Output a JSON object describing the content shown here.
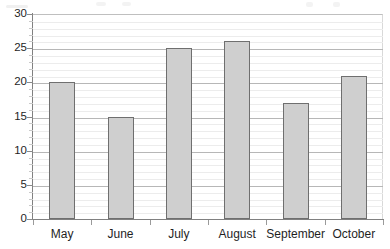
{
  "chart_data": {
    "type": "bar",
    "title": "",
    "xlabel": "",
    "ylabel": "",
    "categories": [
      "May",
      "June",
      "July",
      "August",
      "September",
      "October"
    ],
    "values": [
      20,
      15,
      25,
      26,
      17,
      21
    ],
    "ylim": [
      0,
      30
    ],
    "y_major_ticks": [
      0,
      5,
      10,
      15,
      20,
      25,
      30
    ],
    "y_tick_labels": [
      "0",
      "5",
      "10",
      "15",
      "20",
      "25",
      "30"
    ],
    "y_minor_step": 1,
    "grid": {
      "horizontal_major": true,
      "horizontal_minor": true,
      "vertical": false
    },
    "legend": {
      "visible": false,
      "entries": []
    },
    "series": [
      {
        "name": "",
        "values": [
          20,
          15,
          25,
          26,
          17,
          21
        ]
      }
    ],
    "colors": {
      "bar_fill": "#cfcfcf",
      "bar_border": "#6f6f6f",
      "gridline_major": "#b7b7b7",
      "gridline_minor": "#ececec",
      "axis": "#808080",
      "text": "#1f1f1f",
      "background": "#ffffff"
    }
  }
}
